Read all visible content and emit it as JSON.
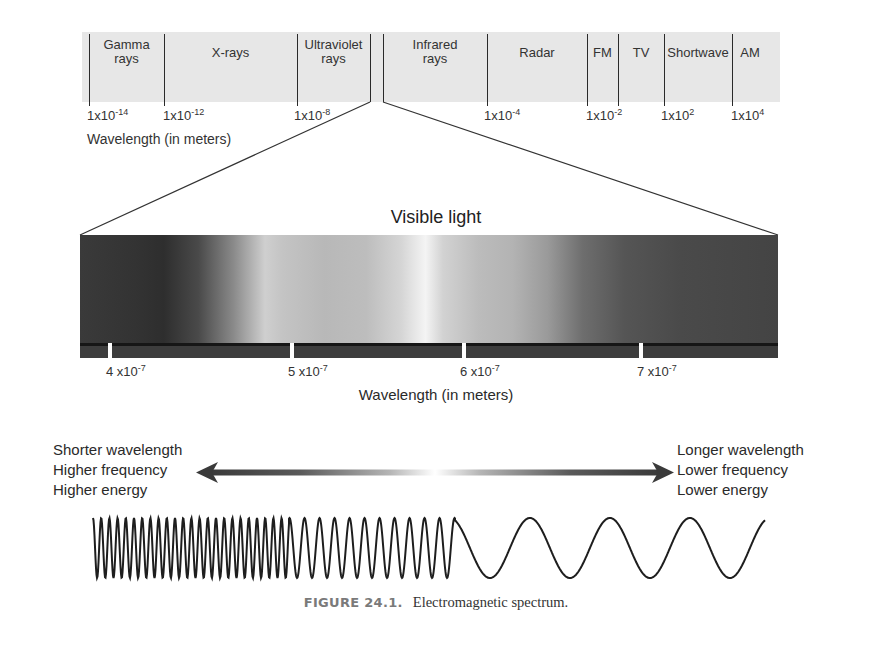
{
  "top_spectrum": {
    "bands": [
      {
        "label_line1": "Gamma",
        "label_line2": "rays",
        "left": 89,
        "right": 164
      },
      {
        "label_line1": "X-rays",
        "label_line2": "",
        "left": 164,
        "right": 297
      },
      {
        "label_line1": "Ultraviolet",
        "label_line2": "rays",
        "left": 297,
        "right": 370
      },
      {
        "label_line1": "Infrared",
        "label_line2": "rays",
        "left": 383,
        "right": 487
      },
      {
        "label_line1": "Radar",
        "label_line2": "",
        "left": 487,
        "right": 587
      },
      {
        "label_line1": "FM",
        "label_line2": "",
        "left": 587,
        "right": 618
      },
      {
        "label_line1": "TV",
        "label_line2": "",
        "left": 618,
        "right": 664
      },
      {
        "label_line1": "Shortwave",
        "label_line2": "",
        "left": 664,
        "right": 732
      },
      {
        "label_line1": "AM",
        "label_line2": "",
        "left": 732,
        "right": 768
      }
    ],
    "ticks": [
      {
        "base": "1x10",
        "exp": "-14",
        "x": 87
      },
      {
        "base": "1x10",
        "exp": "-12",
        "x": 163
      },
      {
        "base": "1x10",
        "exp": "-8",
        "x": 294
      },
      {
        "base": "1x10",
        "exp": "-4",
        "x": 484
      },
      {
        "base": "1x10",
        "exp": "-2",
        "x": 586
      },
      {
        "base": "1x10",
        "exp": "2",
        "x": 661
      },
      {
        "base": "1x10",
        "exp": "4",
        "x": 731
      }
    ],
    "axis_label": "Wavelength (in meters)"
  },
  "visible_light": {
    "title": "Visible light",
    "ticks": [
      {
        "base": "4 x10",
        "exp": "-7",
        "x": 110
      },
      {
        "base": "5 x10",
        "exp": "-7",
        "x": 292
      },
      {
        "base": "6 x10",
        "exp": "-7",
        "x": 464
      },
      {
        "base": "7 x10",
        "exp": "-7",
        "x": 641
      }
    ],
    "axis_label": "Wavelength (in meters)"
  },
  "arrow": {
    "left_text": [
      "Shorter wavelength",
      "Higher frequency",
      "Higher energy"
    ],
    "right_text": [
      "Longer wavelength",
      "Lower frequency",
      "Lower energy"
    ]
  },
  "caption": {
    "figure_number": "FIGURE 24.1.",
    "title": "Electromagnetic spectrum."
  },
  "colors": {
    "band_bg": "#e6e6e6",
    "line": "#2a2a2a",
    "caption_label": "#7a7a7a"
  }
}
